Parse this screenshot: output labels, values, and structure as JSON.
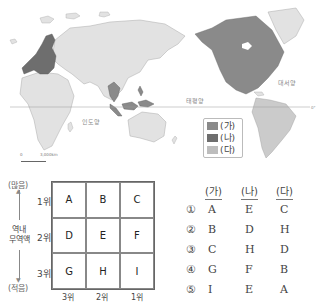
{
  "map": {
    "oceans": {
      "indian": "인도양",
      "pacific": "태평양",
      "atlantic": "대서양"
    },
    "equator_mark": "0°",
    "scale": {
      "zero": "0",
      "distance": "3,000km"
    },
    "colors": {
      "ga": "#8a8a8a",
      "na": "#6e6e6e",
      "da": "#c4c4c4",
      "other": "#e2e2e2"
    },
    "legend": [
      {
        "label": "(가)",
        "color": "#8a8a8a"
      },
      {
        "label": "(나)",
        "color": "#6e6e6e"
      },
      {
        "label": "(다)",
        "color": "#bdbdbd"
      }
    ]
  },
  "matrix": {
    "axis_top": "(많음)",
    "axis_bottom": "(적음)",
    "axis_label_line1": "역내",
    "axis_label_line2": "무역액",
    "row_labels": [
      "1위",
      "2위",
      "3위"
    ],
    "col_labels": [
      "3위",
      "2위",
      "1위"
    ],
    "cells": [
      [
        "A",
        "B",
        "C"
      ],
      [
        "D",
        "E",
        "F"
      ],
      [
        "G",
        "H",
        "I"
      ]
    ]
  },
  "answers": {
    "headers": [
      "(가)",
      "(나)",
      "(다)"
    ],
    "options": [
      {
        "num": "①",
        "ga": "A",
        "na": "E",
        "da": "C"
      },
      {
        "num": "②",
        "ga": "B",
        "na": "D",
        "da": "H"
      },
      {
        "num": "③",
        "ga": "C",
        "na": "H",
        "da": "D"
      },
      {
        "num": "④",
        "ga": "G",
        "na": "F",
        "da": "B"
      },
      {
        "num": "⑤",
        "ga": "I",
        "na": "E",
        "da": "A"
      }
    ]
  }
}
